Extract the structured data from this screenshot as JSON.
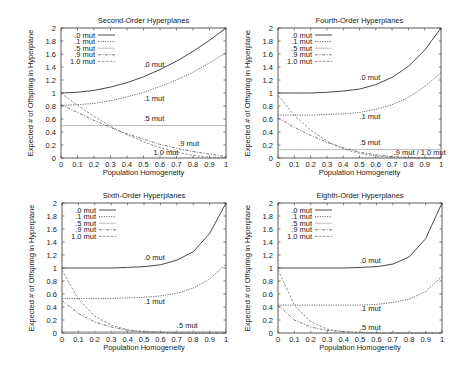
{
  "chart_data": [
    {
      "type": "line",
      "title": "Second-Order Hyperplanes",
      "xlabel": "Population Homogeneity",
      "ylabel": "Expected # of Offspring in Hyperplane",
      "xlim": [
        0,
        1
      ],
      "ylim": [
        0,
        2
      ],
      "xticks": [
        "0",
        "0.1",
        "0.2",
        "0.3",
        "0.4",
        "0.5",
        "0.6",
        "0.7",
        "0.8",
        "0.9",
        "1"
      ],
      "yticks": [
        "0",
        "0.2",
        "0.4",
        "0.6",
        "0.8",
        "1",
        "1.2",
        "1.4",
        "1.6",
        "1.8",
        "2"
      ],
      "legend_position": "upper-left",
      "x": [
        0,
        0.1,
        0.2,
        0.3,
        0.4,
        0.5,
        0.6,
        0.7,
        0.8,
        0.9,
        1
      ],
      "series": [
        {
          "name": ".0 mut",
          "style": "solid",
          "values": [
            1.0,
            1.01,
            1.04,
            1.09,
            1.16,
            1.25,
            1.36,
            1.49,
            1.64,
            1.81,
            2.0
          ]
        },
        {
          "name": ".1 mut",
          "style": "dotted",
          "values": [
            0.81,
            0.82,
            0.84,
            0.88,
            0.94,
            1.01,
            1.1,
            1.2,
            1.32,
            1.46,
            1.62
          ]
        },
        {
          "name": ".5 mut",
          "style": "light",
          "values": [
            0.5,
            0.5,
            0.5,
            0.5,
            0.5,
            0.5,
            0.5,
            0.5,
            0.5,
            0.5,
            0.5
          ]
        },
        {
          "name": ".9 mut",
          "style": "dashdot",
          "values": [
            0.82,
            0.7,
            0.58,
            0.47,
            0.37,
            0.29,
            0.21,
            0.15,
            0.1,
            0.06,
            0.02
          ]
        },
        {
          "name": "1.0 mut",
          "style": "dashed",
          "values": [
            1.0,
            0.81,
            0.64,
            0.49,
            0.36,
            0.25,
            0.16,
            0.09,
            0.04,
            0.01,
            0.0
          ]
        }
      ],
      "annotations": [
        {
          "text": ".0 mut",
          "x": 0.5,
          "y": 1.4
        },
        {
          "text": ".1 mut",
          "x": 0.5,
          "y": 0.88
        },
        {
          "text": ".5 mut",
          "x": 0.5,
          "y": 0.57
        },
        {
          "text": ".9 mut",
          "x": 0.71,
          "y": 0.19
        },
        {
          "text": "1.0 mut",
          "x": 0.56,
          "y": 0.04
        }
      ]
    },
    {
      "type": "line",
      "title": "Fourth-Order Hyperplanes",
      "xlabel": "Population Homogeneity",
      "ylabel": "Expected # of Offspring in Hyperplane",
      "xlim": [
        0,
        1
      ],
      "ylim": [
        0,
        2
      ],
      "xticks": [
        "0",
        "0.1",
        "0.2",
        "0.3",
        "0.4",
        "0.5",
        "0.6",
        "0.7",
        "0.8",
        "0.9",
        "1"
      ],
      "yticks": [
        "0",
        "0.2",
        "0.4",
        "0.6",
        "0.8",
        "1",
        "1.2",
        "1.4",
        "1.6",
        "1.8",
        "2"
      ],
      "legend_position": "upper-left",
      "x": [
        0,
        0.1,
        0.2,
        0.3,
        0.4,
        0.5,
        0.6,
        0.7,
        0.8,
        0.9,
        1
      ],
      "series": [
        {
          "name": ".0 mut",
          "style": "solid",
          "values": [
            1.0,
            1.0,
            1.0,
            1.01,
            1.03,
            1.06,
            1.13,
            1.24,
            1.41,
            1.66,
            2.0
          ]
        },
        {
          "name": ".1 mut",
          "style": "dotted",
          "values": [
            0.66,
            0.66,
            0.66,
            0.67,
            0.68,
            0.7,
            0.75,
            0.82,
            0.93,
            1.1,
            1.31
          ]
        },
        {
          "name": ".5 mut",
          "style": "light",
          "values": [
            0.13,
            0.13,
            0.13,
            0.13,
            0.13,
            0.13,
            0.13,
            0.13,
            0.13,
            0.13,
            0.13
          ]
        },
        {
          "name": ".9 mut",
          "style": "dashdot",
          "values": [
            0.62,
            0.47,
            0.35,
            0.24,
            0.16,
            0.09,
            0.05,
            0.02,
            0.01,
            0.0,
            0.0
          ]
        },
        {
          "name": "1.0 mut",
          "style": "dashed",
          "values": [
            0.96,
            0.66,
            0.43,
            0.26,
            0.14,
            0.07,
            0.03,
            0.01,
            0.0,
            0.0,
            0.0
          ]
        }
      ],
      "annotations": [
        {
          "text": ".0 mut",
          "x": 0.5,
          "y": 1.2
        },
        {
          "text": ".1 mut",
          "x": 0.5,
          "y": 0.6
        },
        {
          "text": ".5 mut",
          "x": 0.5,
          "y": 0.2
        },
        {
          "text": ".9 mut / 1.0 mut",
          "x": 0.71,
          "y": 0.04
        }
      ]
    },
    {
      "type": "line",
      "title": "Sixth-Order Hyperplanes",
      "xlabel": "Population Homogeneity",
      "ylabel": "Expected # of Offspring in Hyperplane",
      "xlim": [
        0,
        1
      ],
      "ylim": [
        0,
        2
      ],
      "xticks": [
        "0",
        "0.1",
        "0.2",
        "0.3",
        "0.4",
        "0.5",
        "0.6",
        "0.7",
        "0.8",
        "0.9",
        "1"
      ],
      "yticks": [
        "0",
        "0.2",
        "0.4",
        "0.6",
        "0.8",
        "1",
        "1.2",
        "1.4",
        "1.6",
        "1.8",
        "2"
      ],
      "legend_position": "upper-left",
      "x": [
        0,
        0.1,
        0.2,
        0.3,
        0.4,
        0.5,
        0.6,
        0.7,
        0.8,
        0.9,
        1
      ],
      "series": [
        {
          "name": ".0 mut",
          "style": "solid",
          "values": [
            1.0,
            1.0,
            1.0,
            1.0,
            1.01,
            1.02,
            1.05,
            1.12,
            1.25,
            1.53,
            2.0
          ]
        },
        {
          "name": ".1 mut",
          "style": "dotted",
          "values": [
            0.53,
            0.53,
            0.53,
            0.53,
            0.54,
            0.55,
            0.57,
            0.61,
            0.69,
            0.83,
            1.06
          ]
        },
        {
          "name": ".5 mut",
          "style": "light",
          "values": [
            0.02,
            0.02,
            0.02,
            0.02,
            0.02,
            0.02,
            0.02,
            0.02,
            0.02,
            0.02,
            0.02
          ]
        },
        {
          "name": ".9 mut",
          "style": "dashdot",
          "values": [
            0.5,
            0.3,
            0.17,
            0.09,
            0.04,
            0.02,
            0.01,
            0.0,
            0.0,
            0.0,
            0.0
          ]
        },
        {
          "name": "1.0 mut",
          "style": "dashed",
          "values": [
            0.97,
            0.52,
            0.26,
            0.12,
            0.05,
            0.02,
            0.01,
            0.0,
            0.0,
            0.0,
            0.0
          ]
        }
      ],
      "annotations": [
        {
          "text": ".0 mut",
          "x": 0.5,
          "y": 1.12
        },
        {
          "text": ".1 mut",
          "x": 0.5,
          "y": 0.44
        },
        {
          "text": ".5 mut",
          "x": 0.7,
          "y": 0.08
        }
      ]
    },
    {
      "type": "line",
      "title": "Eighth-Order Hyperplanes",
      "xlabel": "Population Homogeneity",
      "ylabel": "Expected # of Offspring in Hyperplane",
      "xlim": [
        0,
        1
      ],
      "ylim": [
        0,
        2
      ],
      "xticks": [
        "0",
        "0.1",
        "0.2",
        "0.3",
        "0.4",
        "0.5",
        "0.6",
        "0.7",
        "0.8",
        "0.9",
        "1"
      ],
      "yticks": [
        "0",
        "0.2",
        "0.4",
        "0.6",
        "0.8",
        "1",
        "1.2",
        "1.4",
        "1.6",
        "1.8",
        "2"
      ],
      "legend_position": "upper-left",
      "x": [
        0,
        0.1,
        0.2,
        0.3,
        0.4,
        0.5,
        0.6,
        0.7,
        0.8,
        0.9,
        1
      ],
      "series": [
        {
          "name": ".0 mut",
          "style": "solid",
          "values": [
            1.0,
            1.0,
            1.0,
            1.0,
            1.0,
            1.01,
            1.02,
            1.06,
            1.17,
            1.45,
            2.0
          ]
        },
        {
          "name": ".1 mut",
          "style": "dotted",
          "values": [
            0.43,
            0.43,
            0.43,
            0.43,
            0.43,
            0.43,
            0.44,
            0.47,
            0.52,
            0.64,
            0.87
          ]
        },
        {
          "name": ".5 mut",
          "style": "light",
          "values": [
            0.0,
            0.0,
            0.0,
            0.0,
            0.0,
            0.0,
            0.0,
            0.0,
            0.0,
            0.0,
            0.0
          ]
        },
        {
          "name": ".9 mut",
          "style": "dashdot",
          "values": [
            0.43,
            0.2,
            0.09,
            0.04,
            0.02,
            0.01,
            0.0,
            0.0,
            0.0,
            0.0,
            0.0
          ]
        },
        {
          "name": "1.0 mut",
          "style": "dashed",
          "values": [
            0.97,
            0.43,
            0.17,
            0.06,
            0.02,
            0.01,
            0.0,
            0.0,
            0.0,
            0.0,
            0.0
          ]
        }
      ],
      "annotations": [
        {
          "text": ".0 mut",
          "x": 0.5,
          "y": 1.08
        },
        {
          "text": ".1 mut",
          "x": 0.5,
          "y": 0.34
        },
        {
          "text": ".5 mut",
          "x": 0.5,
          "y": 0.04
        }
      ]
    }
  ],
  "layout": {
    "panels": [
      {
        "left": 61,
        "top": 28,
        "right": 226,
        "bottom": 158
      },
      {
        "left": 278,
        "top": 28,
        "right": 441,
        "bottom": 158
      },
      {
        "left": 62,
        "top": 203,
        "right": 226,
        "bottom": 333
      },
      {
        "left": 278,
        "top": 203,
        "right": 442,
        "bottom": 333
      }
    ]
  }
}
